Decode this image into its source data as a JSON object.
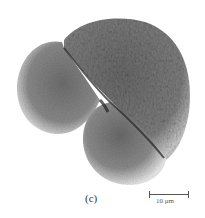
{
  "figure": {
    "panel_label": "(c)",
    "scale_bar": {
      "label": "10 μm",
      "length_px": 40
    },
    "colors": {
      "background": "#ffffff",
      "specimen_dark": "#3a3a3a",
      "specimen_mid": "#7a7a7a",
      "specimen_light": "#d8d8d8",
      "scale_bar": "#555555"
    }
  }
}
